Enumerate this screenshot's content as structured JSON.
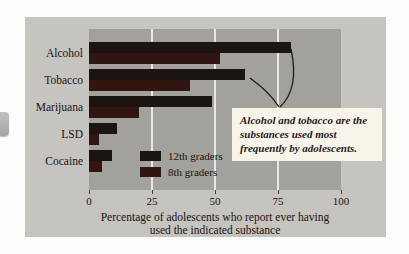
{
  "figure": {
    "panel_bg": "#c6c4bf",
    "plot_bg": "#a3a19c",
    "gridline_color": "#eae8e3"
  },
  "chart_data": {
    "type": "bar",
    "orientation": "horizontal",
    "categories": [
      "Alcohol",
      "Tobacco",
      "Marijuana",
      "LSD",
      "Cocaine"
    ],
    "series": [
      {
        "name": "12th graders",
        "color": "#1b1413",
        "values": [
          80,
          62,
          49,
          11,
          9
        ]
      },
      {
        "name": "8th graders",
        "color": "#311511",
        "values": [
          52,
          40,
          20,
          4,
          5
        ]
      }
    ],
    "x_ticks": [
      0,
      25,
      50,
      75,
      100
    ],
    "xlim": [
      0,
      100
    ],
    "grid": "vertical lines at 25, 50, 75",
    "legend_position": "inside bottom-left of plot",
    "xlabel_line1": "Percentage of adolescents who report ever having",
    "xlabel_line2": "used the indicated substance"
  },
  "annotation": {
    "text": "Alcohol and tobacco are the substances used most frequently by adolescents.",
    "bg": "#f8f4e9",
    "pointer_color": "#1c1917"
  }
}
